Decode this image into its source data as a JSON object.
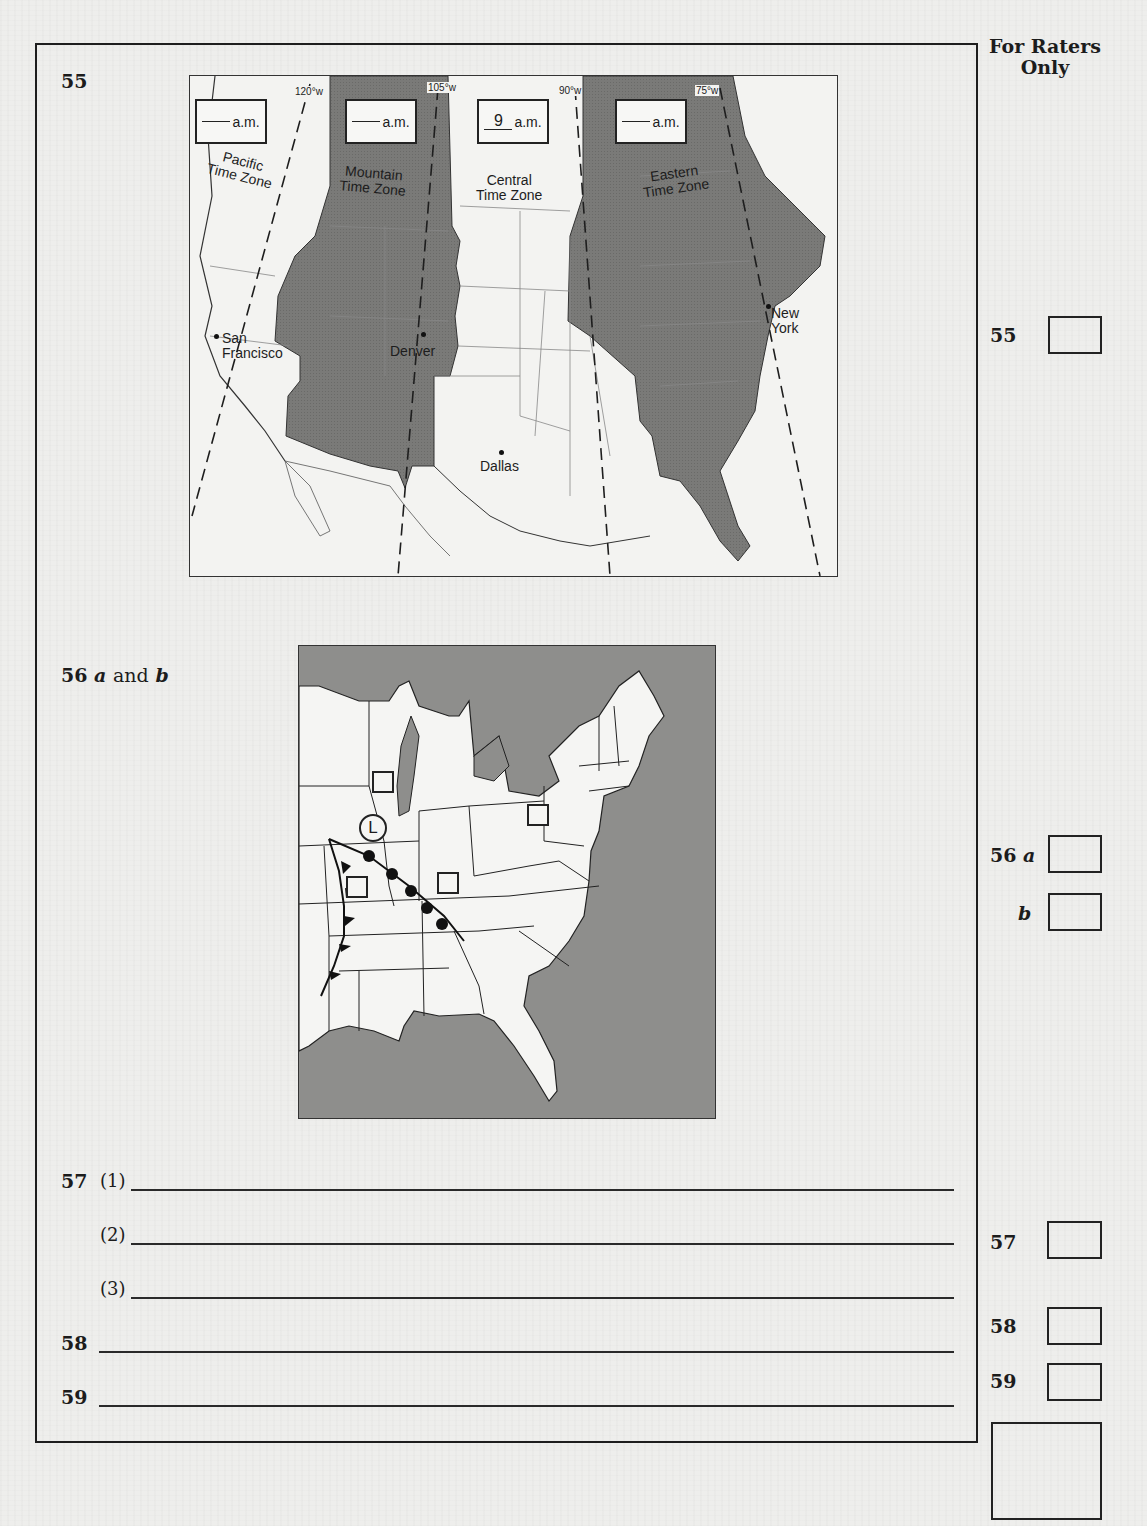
{
  "header": {
    "raters_title_line1": "For Raters",
    "raters_title_line2": "Only"
  },
  "q55": {
    "number": "55",
    "longitudes": [
      "120°w",
      "105°w",
      "90°w",
      "75°w"
    ],
    "time_boxes": [
      {
        "zone": "Pacific",
        "value": "",
        "suffix": "a.m."
      },
      {
        "zone": "Mountain",
        "value": "",
        "suffix": "a.m."
      },
      {
        "zone": "Central",
        "value": "9",
        "suffix": "a.m."
      },
      {
        "zone": "Eastern",
        "value": "",
        "suffix": "a.m."
      }
    ],
    "zone_labels": {
      "pacific_1": "Pacific",
      "pacific_2": "Time Zone",
      "mountain_1": "Mountain",
      "mountain_2": "Time Zone",
      "central_1": "Central",
      "central_2": "Time Zone",
      "eastern_1": "Eastern",
      "eastern_2": "Time Zone"
    },
    "cities": {
      "sf_1": "San",
      "sf_2": "Francisco",
      "denver": "Denver",
      "dallas": "Dallas",
      "ny_1": "New",
      "ny_2": "York"
    },
    "colors": {
      "shaded_zone": "#7d7d7b",
      "unshaded_zone": "#f3f3f1"
    }
  },
  "q56": {
    "label_num": "56",
    "label_a": "a",
    "label_and": "and",
    "label_b": "b",
    "low_pressure_symbol": "L",
    "station_box_count": 5,
    "colors": {
      "water": "#8e8e8c",
      "land": "#f5f5f3"
    }
  },
  "q57": {
    "number": "57",
    "parts": [
      "(1)",
      "(2)",
      "(3)"
    ]
  },
  "q58": {
    "number": "58"
  },
  "q59": {
    "number": "59"
  },
  "rater_column": {
    "items": [
      {
        "label": "55"
      },
      {
        "label": "56",
        "sub": "a"
      },
      {
        "label": "",
        "sub": "b"
      },
      {
        "label": "57"
      },
      {
        "label": "58"
      },
      {
        "label": "59"
      }
    ]
  }
}
